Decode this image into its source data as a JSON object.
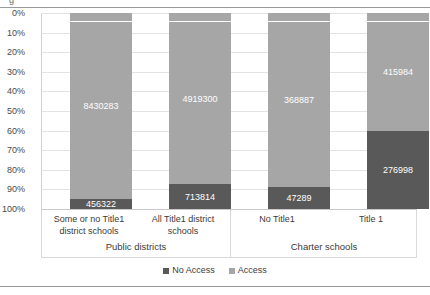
{
  "title_sliver": "g",
  "chart_data": {
    "type": "bar",
    "subtype": "stacked-100-percent",
    "title": "",
    "xlabel": "",
    "ylabel": "",
    "ylim": [
      0,
      100
    ],
    "yticks": [
      "0%",
      "10%",
      "20%",
      "30%",
      "40%",
      "50%",
      "60%",
      "70%",
      "80%",
      "90%",
      "100%"
    ],
    "grid": true,
    "legend_position": "bottom",
    "categories": [
      "Some or no Title1 district schools",
      "All Title1 district schools",
      "No Title1",
      "Title 1"
    ],
    "groups": [
      {
        "label": "Public districts",
        "categories": [
          "Some or no Title1 district schools",
          "All Title1 district schools"
        ]
      },
      {
        "label": "Charter schools",
        "categories": [
          "No Title1",
          "Title 1"
        ]
      }
    ],
    "series": [
      {
        "name": "No Access",
        "color": "#595959",
        "values": [
          456322,
          713814,
          47289,
          276998
        ],
        "labels": [
          "456322",
          "713814",
          "47289",
          "276998"
        ],
        "percents": [
          5.1,
          12.7,
          11.4,
          40.0
        ]
      },
      {
        "name": "Access",
        "color": "#a6a6a6",
        "values": [
          8430283,
          4919300,
          368887,
          415984
        ],
        "labels": [
          "8430283",
          "4919300",
          "368887",
          "415984"
        ],
        "percents": [
          94.9,
          87.3,
          88.6,
          60.0
        ]
      }
    ]
  },
  "legend": {
    "items": [
      {
        "label": "No Access",
        "color": "#595959"
      },
      {
        "label": "Access",
        "color": "#a6a6a6"
      }
    ]
  }
}
